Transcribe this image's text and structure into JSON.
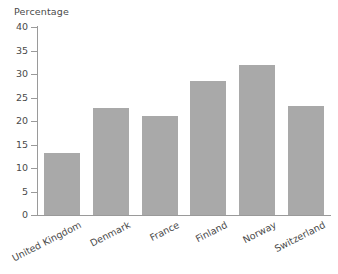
{
  "chart_data": {
    "type": "bar",
    "title": "",
    "ylabel": "Percentage",
    "xlabel": "",
    "categories": [
      "United Kingdom",
      "Denmark",
      "France",
      "Finland",
      "Norway",
      "Switzerland"
    ],
    "values": [
      13.3,
      22.7,
      21.1,
      28.6,
      32.0,
      23.3
    ],
    "ylim": [
      0,
      40
    ],
    "ytick_step": 5,
    "yticks": [
      "40",
      "35",
      "30",
      "25",
      "20",
      "15",
      "10",
      "5",
      "0"
    ],
    "grid": false,
    "legend": "none",
    "bar_color": "#a9a9a9",
    "axis_color": "#9a9a9a",
    "text_color": "#4a4a4a"
  }
}
